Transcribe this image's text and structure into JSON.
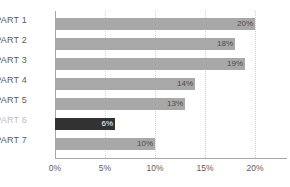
{
  "chart_data": {
    "type": "bar",
    "orientation": "horizontal",
    "title": "",
    "xlabel": "",
    "ylabel": "",
    "categories": [
      "PART 1",
      "PART 2",
      "PART 3",
      "PART 4",
      "PART 5",
      "PART 6",
      "PART 7"
    ],
    "values": [
      20,
      18,
      19,
      14,
      13,
      6,
      10
    ],
    "value_labels": [
      "20%",
      "18%",
      "19%",
      "14%",
      "13%",
      "6%",
      "10%"
    ],
    "xlim": [
      0,
      21.5
    ],
    "xticks": [
      0,
      5,
      10,
      15,
      20
    ],
    "xtick_labels": [
      "0%",
      "5%",
      "10%",
      "15%",
      "20%"
    ],
    "grid": "vertical-dotted",
    "legend": "none",
    "highlight_index": 5,
    "colors": {
      "bar": "#a8a8a8",
      "bar_highlight": "#323232",
      "label": "#5c5c5c",
      "label_muted": "#bdbdbd",
      "value_label": "#4a4a4a",
      "value_label_inside": "#ffffff",
      "axis": "#a6a6a6",
      "gridline": "#d2d2d2",
      "background": "#ffffff"
    }
  }
}
